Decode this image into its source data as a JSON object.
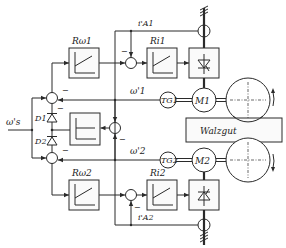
{
  "diagram": {
    "type": "control-block-diagram",
    "input": {
      "label": "ω's"
    },
    "labels": {
      "speed_controller_1": "Rω1",
      "speed_controller_2": "Rω2",
      "current_controller_1": "Ri1",
      "current_controller_2": "Ri2",
      "current_feedback_1": "i'A1",
      "current_feedback_2": "i'A2",
      "speed_feedback_1": "ω'1",
      "speed_feedback_2": "ω'2",
      "diode_1": "D1",
      "diode_2": "D2",
      "tacho_1": "TG1",
      "tacho_2": "TG2",
      "motor_1": "M1",
      "motor_2": "M2",
      "workpiece": "Walzgut"
    },
    "signs": {
      "minus": "−"
    },
    "nodes": [
      {
        "id": "sum-speed-1",
        "type": "summing-junction"
      },
      {
        "id": "sum-current-1",
        "type": "summing-junction"
      },
      {
        "id": "sum-speed-2",
        "type": "summing-junction"
      },
      {
        "id": "sum-current-2",
        "type": "summing-junction"
      },
      {
        "id": "sum-difference",
        "type": "summing-junction"
      },
      {
        "id": "limiter",
        "type": "block"
      },
      {
        "id": "thyristor-converter-1",
        "type": "block"
      },
      {
        "id": "thyristor-converter-2",
        "type": "block"
      },
      {
        "id": "roll-1",
        "type": "roll"
      },
      {
        "id": "roll-2",
        "type": "roll"
      }
    ]
  }
}
